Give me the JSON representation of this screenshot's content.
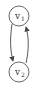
{
  "diagram": {
    "type": "directed-graph",
    "nodes": [
      {
        "id": "v1",
        "label": "v",
        "subscript": "1",
        "cx": 19,
        "cy": 16,
        "r": 10
      },
      {
        "id": "v2",
        "label": "v",
        "subscript": "2",
        "cx": 19,
        "cy": 72,
        "r": 10
      }
    ],
    "edges": [
      {
        "from": "v1",
        "to": "v2",
        "side": "left"
      },
      {
        "from": "v2",
        "to": "v1",
        "side": "right"
      }
    ],
    "colors": {
      "stroke": "#555555",
      "text": "#333333",
      "background": "#ffffff"
    }
  }
}
